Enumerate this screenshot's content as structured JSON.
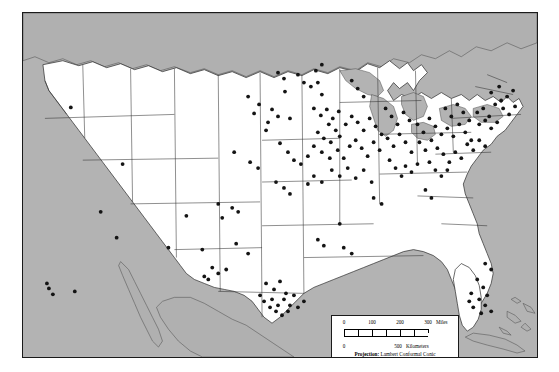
{
  "figure": {
    "kind": "dot-distribution-map",
    "region": "Conterminous United States",
    "background_color": "#b3b3b3",
    "land_color": "#ffffff",
    "foreign_land_color": "#b0b0b0",
    "dot_color": "#141414",
    "frame_color": "#1a1a1a"
  },
  "legend": {
    "miles": {
      "labels": [
        "0",
        "100",
        "200",
        "300"
      ],
      "unit": "Miles",
      "values": [
        0,
        100,
        200,
        300
      ]
    },
    "kilometers": {
      "labels": [
        "0",
        "500"
      ],
      "unit": "Kilometers",
      "values": [
        0,
        500
      ]
    },
    "projection_label": "Projection:",
    "projection_name": "Lambert Conformal Conic",
    "standard_parallels": "Standard Parallels 33°N, 45°N"
  },
  "chart_data": {
    "type": "scatter",
    "title": "",
    "xlabel": "",
    "ylabel": "",
    "note": "Point locations plotted on a Lambert Conformal Conic map of the United States. Coordinates are given in map-frame pixel units (x right, y down) within the 516x346 map panel.",
    "series": [
      {
        "name": "locations",
        "marker": "filled-circle",
        "marker_color": "#141414",
        "points": [
          [
            48,
            95
          ],
          [
            78,
            200
          ],
          [
            94,
            226
          ],
          [
            24,
            272
          ],
          [
            26,
            277
          ],
          [
            30,
            283
          ],
          [
            52,
            280
          ],
          [
            182,
            265
          ],
          [
            186,
            268
          ],
          [
            263,
            79
          ],
          [
            250,
            97
          ],
          [
            256,
            104
          ],
          [
            268,
            106
          ],
          [
            244,
            118
          ],
          [
            258,
            131
          ],
          [
            212,
            140
          ],
          [
            228,
            150
          ],
          [
            236,
            156
          ],
          [
            196,
            192
          ],
          [
            210,
            196
          ],
          [
            216,
            200
          ],
          [
            200,
            206
          ],
          [
            226,
            84
          ],
          [
            237,
            92
          ],
          [
            232,
            101
          ],
          [
            246,
            110
          ],
          [
            276,
            62
          ],
          [
            282,
            70
          ],
          [
            289,
            74
          ],
          [
            296,
            70
          ],
          [
            300,
            82
          ],
          [
            266,
            140
          ],
          [
            272,
            148
          ],
          [
            279,
            152
          ],
          [
            286,
            144
          ],
          [
            254,
            170
          ],
          [
            262,
            176
          ],
          [
            268,
            182
          ],
          [
            292,
            96
          ],
          [
            299,
            103
          ],
          [
            305,
            97
          ],
          [
            311,
            106
          ],
          [
            317,
            99
          ],
          [
            307,
            112
          ],
          [
            314,
            118
          ],
          [
            296,
            120
          ],
          [
            302,
            126
          ],
          [
            309,
            130
          ],
          [
            318,
            124
          ],
          [
            324,
            112
          ],
          [
            330,
            104
          ],
          [
            292,
            134
          ],
          [
            300,
            140
          ],
          [
            308,
            146
          ],
          [
            316,
            138
          ],
          [
            322,
            146
          ],
          [
            328,
            134
          ],
          [
            336,
            110
          ],
          [
            342,
            118
          ],
          [
            348,
            106
          ],
          [
            354,
            114
          ],
          [
            360,
            122
          ],
          [
            334,
            128
          ],
          [
            340,
            136
          ],
          [
            346,
            144
          ],
          [
            352,
            130
          ],
          [
            358,
            138
          ],
          [
            310,
            158
          ],
          [
            318,
            164
          ],
          [
            326,
            156
          ],
          [
            334,
            166
          ],
          [
            342,
            158
          ],
          [
            350,
            170
          ],
          [
            300,
            170
          ],
          [
            292,
            164
          ],
          [
            286,
            172
          ],
          [
            364,
            96
          ],
          [
            370,
            104
          ],
          [
            376,
            112
          ],
          [
            382,
            100
          ],
          [
            388,
            108
          ],
          [
            366,
            126
          ],
          [
            372,
            134
          ],
          [
            378,
            122
          ],
          [
            384,
            130
          ],
          [
            390,
            140
          ],
          [
            396,
            112
          ],
          [
            402,
            120
          ],
          [
            408,
            106
          ],
          [
            414,
            114
          ],
          [
            420,
            122
          ],
          [
            398,
            130
          ],
          [
            404,
            138
          ],
          [
            410,
            128
          ],
          [
            416,
            136
          ],
          [
            424,
            96
          ],
          [
            430,
            104
          ],
          [
            436,
            92
          ],
          [
            442,
            100
          ],
          [
            448,
            108
          ],
          [
            426,
            116
          ],
          [
            432,
            124
          ],
          [
            438,
            112
          ],
          [
            444,
            120
          ],
          [
            450,
            128
          ],
          [
            456,
            100
          ],
          [
            462,
            96
          ],
          [
            468,
            104
          ],
          [
            474,
            92
          ],
          [
            480,
            88
          ],
          [
            458,
            112
          ],
          [
            464,
            108
          ],
          [
            470,
            116
          ],
          [
            476,
            110
          ],
          [
            446,
            132
          ],
          [
            452,
            138
          ],
          [
            458,
            128
          ],
          [
            464,
            134
          ],
          [
            434,
            140
          ],
          [
            440,
            146
          ],
          [
            428,
            150
          ],
          [
            422,
            142
          ],
          [
            486,
            84
          ],
          [
            492,
            78
          ],
          [
            478,
            74
          ],
          [
            470,
            80
          ],
          [
            482,
            96
          ],
          [
            488,
            102
          ],
          [
            494,
            94
          ],
          [
            408,
            150
          ],
          [
            414,
            158
          ],
          [
            420,
            164
          ],
          [
            426,
            158
          ],
          [
            396,
            152
          ],
          [
            390,
            160
          ],
          [
            384,
            154
          ],
          [
            368,
            148
          ],
          [
            374,
            156
          ],
          [
            380,
            164
          ],
          [
            352,
            186
          ],
          [
            360,
            192
          ],
          [
            214,
            232
          ],
          [
            226,
            242
          ],
          [
            190,
            256
          ],
          [
            196,
            262
          ],
          [
            204,
            258
          ],
          [
            244,
            272
          ],
          [
            252,
            278
          ],
          [
            258,
            270
          ],
          [
            264,
            282
          ],
          [
            250,
            288
          ],
          [
            256,
            294
          ],
          [
            262,
            288
          ],
          [
            268,
            294
          ],
          [
            272,
            284
          ],
          [
            266,
            300
          ],
          [
            260,
            304
          ],
          [
            254,
            300
          ],
          [
            248,
            296
          ],
          [
            242,
            290
          ],
          [
            238,
            284
          ],
          [
            276,
            296
          ],
          [
            282,
            290
          ],
          [
            180,
            238
          ],
          [
            318,
            212
          ],
          [
            456,
            268
          ],
          [
            462,
            276
          ],
          [
            450,
            282
          ],
          [
            458,
            288
          ],
          [
            464,
            294
          ],
          [
            452,
            296
          ],
          [
            460,
            302
          ],
          [
            466,
            284
          ],
          [
            448,
            290
          ],
          [
            470,
            300
          ],
          [
            470,
            258
          ],
          [
            464,
            252
          ],
          [
            410,
            186
          ],
          [
            404,
            178
          ],
          [
            322,
            236
          ],
          [
            330,
            242
          ],
          [
            296,
            228
          ],
          [
            302,
            234
          ],
          [
            342,
            84
          ],
          [
            336,
            76
          ],
          [
            330,
            68
          ],
          [
            294,
            58
          ],
          [
            300,
            52
          ],
          [
            256,
            60
          ],
          [
            262,
            66
          ],
          [
            100,
            152
          ],
          [
            164,
            204
          ],
          [
            146,
            236
          ]
        ]
      }
    ]
  }
}
